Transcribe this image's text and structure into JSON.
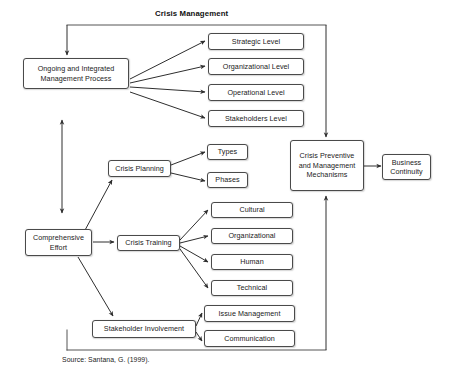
{
  "diagram": {
    "title": "Crisis Management",
    "source": "Source: Santana, G. (1999).",
    "line_color": "#4a4a4a",
    "text_color": "#1a1a1a",
    "background": "#ffffff",
    "nodes": {
      "ongoing_process": "Ongoing and Integrated Management Process",
      "strategic_level": "Strategic Level",
      "organizational_level": "Organizational Level",
      "operational_level": "Operational Level",
      "stakeholders_level": "Stakeholders Level",
      "crisis_planning": "Crisis Planning",
      "types": "Types",
      "phases": "Phases",
      "comprehensive_effort": "Comprehensive Effort",
      "crisis_training": "Crisis Training",
      "cultural": "Cultural",
      "organizational": "Organizational",
      "human": "Human",
      "technical": "Technical",
      "stakeholder_involvement": "Stakeholder Involvement",
      "issue_management": "Issue Management",
      "communication": "Communication",
      "crisis_mechanisms": "Crisis Preventive and Management Mechanisms",
      "business_continuity": "Business Continuity"
    }
  }
}
